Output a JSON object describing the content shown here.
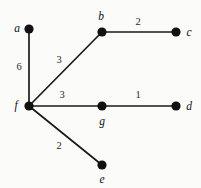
{
  "figure": {
    "type": "weighted-undirected-graph",
    "background_color": "#fbfbf9",
    "node_color": "#111111",
    "edge_color": "#1a1a1a",
    "width": 201,
    "height": 188
  },
  "nodes": [
    {
      "id": "a",
      "label": "a",
      "x": 29,
      "y": 29,
      "label_x": 17,
      "label_y": 29
    },
    {
      "id": "b",
      "label": "b",
      "x": 102,
      "y": 32,
      "label_x": 101,
      "label_y": 17
    },
    {
      "id": "c",
      "label": "c",
      "x": 176,
      "y": 32,
      "label_x": 189,
      "label_y": 33
    },
    {
      "id": "d",
      "label": "d",
      "x": 176,
      "y": 106,
      "label_x": 189,
      "label_y": 107
    },
    {
      "id": "e",
      "label": "e",
      "x": 102,
      "y": 165,
      "label_x": 102,
      "label_y": 180
    },
    {
      "id": "f",
      "label": "f",
      "x": 29,
      "y": 106,
      "label_x": 16,
      "label_y": 106
    },
    {
      "id": "g",
      "label": "g",
      "x": 102,
      "y": 106,
      "label_x": 102,
      "label_y": 122
    }
  ],
  "edges": [
    {
      "id": "a-f",
      "source": "a",
      "target": "f",
      "weight": "6",
      "label_x": 19,
      "label_y": 67
    },
    {
      "id": "f-b",
      "source": "f",
      "target": "b",
      "weight": "3",
      "label_x": 59,
      "label_y": 60
    },
    {
      "id": "b-c",
      "source": "b",
      "target": "c",
      "weight": "2",
      "label_x": 138,
      "label_y": 22
    },
    {
      "id": "f-g",
      "source": "f",
      "target": "g",
      "weight": "3",
      "label_x": 62,
      "label_y": 95
    },
    {
      "id": "g-d",
      "source": "g",
      "target": "d",
      "weight": "1",
      "label_x": 138,
      "label_y": 95
    },
    {
      "id": "f-e",
      "source": "f",
      "target": "e",
      "weight": "2",
      "label_x": 59,
      "label_y": 146
    }
  ],
  "node_radius": 4.6
}
